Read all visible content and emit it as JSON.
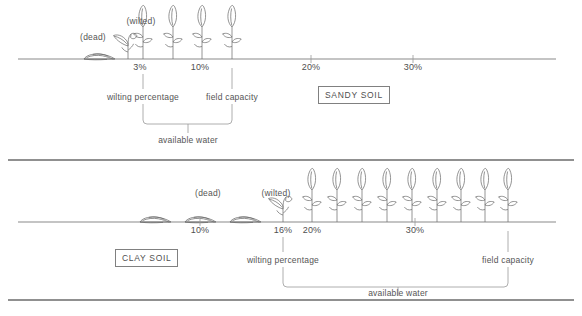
{
  "figure": {
    "line_color": "#6e6e6e",
    "text_color": "#555555"
  },
  "panels": [
    {
      "id": "sandy",
      "soil_label": "SANDY SOIL",
      "axis_y": 59,
      "axis_x0": 18,
      "axis_x1": 556,
      "annotations": [
        {
          "name": "dead",
          "text": "(dead)",
          "x": 93,
          "y": 36
        },
        {
          "name": "wilted",
          "text": "(wilted)",
          "x": 141,
          "y": 21
        }
      ],
      "ticks": [
        {
          "label": "3%",
          "x": 140
        },
        {
          "label": "10%",
          "x": 200
        },
        {
          "label": "20%",
          "x": 311
        },
        {
          "label": "30%",
          "x": 413
        }
      ],
      "markers": [
        {
          "name": "wilting-percentage",
          "label": "wilting percentage",
          "x": 143,
          "value": "3%"
        },
        {
          "name": "field-capacity",
          "label": "field capacity",
          "x": 232,
          "value": "10%"
        }
      ],
      "bracket": {
        "label": "available water",
        "x0": 143,
        "x1": 232,
        "center": 188
      },
      "dead_plants": 1,
      "wilted_plants": 1,
      "healthy_plants": 4
    },
    {
      "id": "clay",
      "soil_label": "CLAY SOIL",
      "axis_y": 222,
      "axis_x0": 18,
      "axis_x1": 556,
      "annotations": [
        {
          "name": "dead",
          "text": "(dead)",
          "x": 208,
          "y": 192
        },
        {
          "name": "wilted",
          "text": "(wilted)",
          "x": 276,
          "y": 192
        },
        {
          "name": "wilted2",
          "text": "",
          "x": 0,
          "y": 0
        }
      ],
      "ticks": [
        {
          "label": "10%",
          "x": 200
        },
        {
          "label": "16%",
          "x": 283
        },
        {
          "label": "20%",
          "x": 312
        },
        {
          "label": "30%",
          "x": 415
        }
      ],
      "markers": [
        {
          "name": "wilting-percentage",
          "label": "wilting percentage",
          "x": 283,
          "value": "16%"
        },
        {
          "name": "field-capacity",
          "label": "field capacity",
          "x": 508,
          "value": "field capacity"
        }
      ],
      "bracket": {
        "label": "available water",
        "x0": 283,
        "x1": 508,
        "center": 398
      },
      "dead_plants": 3,
      "wilted_plants": 1,
      "healthy_plants": 9
    }
  ],
  "labels": {
    "available_water": "available water",
    "wilting_percentage": "wilting percentage",
    "field_capacity": "field capacity",
    "dead": "(dead)",
    "wilted": "(wilted)"
  }
}
